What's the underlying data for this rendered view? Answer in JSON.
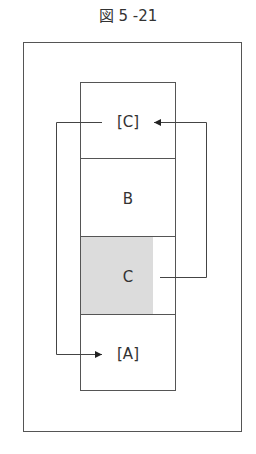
{
  "figure": {
    "title": "図 5 -21",
    "cells": [
      {
        "label": "[C]",
        "shaded": false
      },
      {
        "label": "B",
        "shaded": false
      },
      {
        "label": "C",
        "shaded": true
      },
      {
        "label": "[A]",
        "shaded": false
      }
    ],
    "arrows": [
      {
        "from": "C",
        "to": "[C]",
        "side": "right"
      },
      {
        "from": "[C]",
        "to": "[A]",
        "side": "left"
      }
    ],
    "colors": {
      "line": "#555555",
      "shade": "#d9d9d9"
    }
  }
}
